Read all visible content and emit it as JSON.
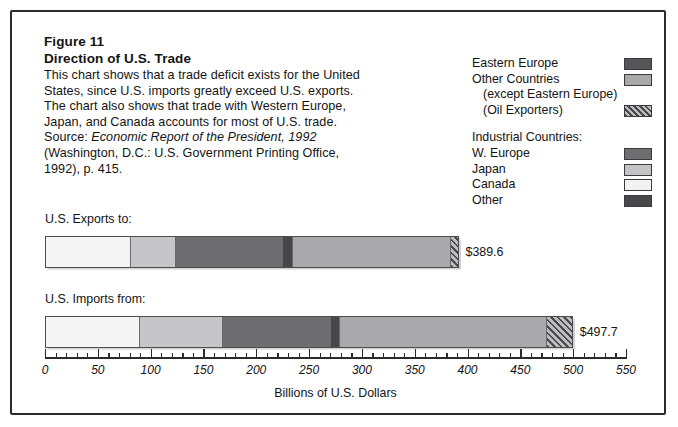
{
  "figure": {
    "number": "Figure 11",
    "title": "Direction of U.S. Trade",
    "description_lines": [
      "This chart shows that a trade deficit exists for the United",
      "States, since U.S. imports greatly exceed U.S. exports.",
      "The chart also shows that trade with Western Europe,",
      "Japan, and Canada accounts for most of U.S. trade."
    ],
    "source_prefix": "Source: ",
    "source_italic": "Economic Report of the President, 1992",
    "source_lines": [
      "(Washington, D.C.: U.S. Government Printing Office,",
      "1992), p. 415."
    ]
  },
  "legend": {
    "rows": [
      {
        "label": "Eastern Europe",
        "swatch": "sw-eastern",
        "indent": false,
        "group_head": false,
        "has_swatch": true
      },
      {
        "label": "Other Countries",
        "swatch": "sw-other-c",
        "indent": false,
        "group_head": false,
        "has_swatch": true
      },
      {
        "label": "(except Eastern Europe)",
        "swatch": "",
        "indent": true,
        "group_head": false,
        "has_swatch": false
      },
      {
        "label": "(Oil Exporters)",
        "swatch": "sw-oil",
        "indent": true,
        "group_head": false,
        "has_swatch": true
      },
      {
        "label": "Industrial Countries:",
        "swatch": "",
        "indent": false,
        "group_head": true,
        "has_swatch": false
      },
      {
        "label": "W. Europe",
        "swatch": "sw-weurope",
        "indent": false,
        "group_head": false,
        "has_swatch": true
      },
      {
        "label": "Japan",
        "swatch": "sw-japan",
        "indent": false,
        "group_head": false,
        "has_swatch": true
      },
      {
        "label": "Canada",
        "swatch": "sw-canada",
        "indent": false,
        "group_head": false,
        "has_swatch": true
      },
      {
        "label": "Other",
        "swatch": "sw-otherind",
        "indent": false,
        "group_head": false,
        "has_swatch": true
      }
    ]
  },
  "chart_data": {
    "type": "bar",
    "orientation": "horizontal",
    "stacked": true,
    "title": "Direction of U.S. Trade",
    "xlabel": "Billions of U.S. Dollars",
    "ylabel": "",
    "xlim": [
      0,
      550
    ],
    "xticks": [
      0,
      50,
      100,
      150,
      200,
      250,
      300,
      350,
      400,
      450,
      500,
      550
    ],
    "xtick_labels": [
      "0",
      "50",
      "100",
      "150",
      "200",
      "250",
      "300",
      "350",
      "400",
      "450",
      "500",
      "550"
    ],
    "minor_tick_step": 10,
    "grid": false,
    "legend_position": "top-right",
    "series": [
      {
        "name": "Canada",
        "key": "canada",
        "values": [
          80.0,
          89.0
        ]
      },
      {
        "name": "Japan",
        "key": "japan",
        "values": [
          43.0,
          79.0
        ]
      },
      {
        "name": "W. Europe",
        "key": "weurope",
        "values": [
          101.0,
          102.0
        ]
      },
      {
        "name": "Other",
        "key": "otherind",
        "values": [
          10.0,
          8.0
        ]
      },
      {
        "name": "Other Countries",
        "key": "otherc",
        "values": [
          149.6,
          196.7
        ]
      },
      {
        "name": "Oil Exporters",
        "key": "oil",
        "values": [
          6.0,
          23.0
        ]
      }
    ],
    "categories": [
      "U.S. Exports to:",
      "U.S. Imports from:"
    ],
    "totals": [
      389.6,
      497.7
    ],
    "total_labels": [
      "$389.6",
      "$497.7"
    ]
  },
  "bars": [
    {
      "label": "U.S. Exports to:",
      "total_label": "$389.6",
      "segments": [
        {
          "key": "canada",
          "name": "Canada",
          "value": 80.0
        },
        {
          "key": "japan",
          "name": "Japan",
          "value": 43.0
        },
        {
          "key": "weurope",
          "name": "W. Europe",
          "value": 101.0
        },
        {
          "key": "otherind",
          "name": "Other",
          "value": 10.0
        },
        {
          "key": "otherc",
          "name": "Other Countries",
          "value": 149.6
        },
        {
          "key": "oil",
          "name": "Oil Exporters",
          "value": 6.0
        }
      ]
    },
    {
      "label": "U.S. Imports from:",
      "total_label": "$497.7",
      "segments": [
        {
          "key": "canada",
          "name": "Canada",
          "value": 89.0
        },
        {
          "key": "japan",
          "name": "Japan",
          "value": 79.0
        },
        {
          "key": "weurope",
          "name": "W. Europe",
          "value": 102.0
        },
        {
          "key": "otherind",
          "name": "Other",
          "value": 8.0
        },
        {
          "key": "otherc",
          "name": "Other Countries",
          "value": 196.7
        },
        {
          "key": "oil",
          "name": "Oil Exporters",
          "value": 23.0
        }
      ]
    }
  ],
  "axis": {
    "title": "Billions of U.S. Dollars"
  },
  "colors": {
    "eastern_europe": "#56565a",
    "other_countries": "#a9a9ab",
    "oil_exporters": "#bcbcbe",
    "w_europe": "#6e6e71",
    "japan": "#c6c6c8",
    "canada": "#f4f4f4",
    "other_industrial": "#47474b",
    "frame": "#2b2b2b",
    "text": "#141414"
  }
}
